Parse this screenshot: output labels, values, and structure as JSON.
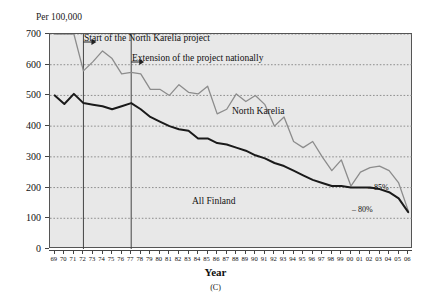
{
  "figure": {
    "unit_label": "Per 100,000",
    "xlabel": "Year",
    "caption": "(C)"
  },
  "annotations": {
    "start_project": "Start of the North Karelia project",
    "extension_project": "Extension of the project nationally",
    "pct_north_karelia": "– 85%",
    "pct_all_finland": "– 80%"
  },
  "series_labels": {
    "north_karelia": "North Karelia",
    "all_finland": "All Finland"
  },
  "colors": {
    "north_karelia": "#8c8c8c",
    "all_finland": "#1a1a1a",
    "plot_background": "#e8e8e8",
    "gridline": "#777777",
    "frame": "#555555",
    "marker_line": "#444444"
  },
  "chart_data": {
    "type": "line",
    "title": "",
    "subtitle": "",
    "xlabel": "Year",
    "ylabel": "Per 100,000",
    "ylim": [
      0,
      700
    ],
    "yticks": [
      0,
      100,
      200,
      300,
      400,
      500,
      600,
      700
    ],
    "grid": true,
    "legend": "inline-labels",
    "x": [
      "69",
      "70",
      "71",
      "72",
      "73",
      "74",
      "75",
      "76",
      "77",
      "78",
      "79",
      "80",
      "81",
      "82",
      "83",
      "84",
      "85",
      "86",
      "87",
      "88",
      "89",
      "90",
      "91",
      "92",
      "93",
      "94",
      "95",
      "96",
      "97",
      "98",
      "99",
      "00",
      "01",
      "02",
      "03",
      "04",
      "05",
      "06"
    ],
    "categories": [
      1969,
      1970,
      1971,
      1972,
      1973,
      1974,
      1975,
      1976,
      1977,
      1978,
      1979,
      1980,
      1981,
      1982,
      1983,
      1984,
      1985,
      1986,
      1987,
      1988,
      1989,
      1990,
      1991,
      1992,
      1993,
      1994,
      1995,
      1996,
      1997,
      1998,
      1999,
      2000,
      2001,
      2002,
      2003,
      2004,
      2005,
      2006
    ],
    "series": [
      {
        "name": "North Karelia",
        "color": "#8c8c8c",
        "values": [
          700,
          700,
          700,
          580,
          610,
          645,
          620,
          570,
          575,
          570,
          520,
          520,
          500,
          535,
          510,
          505,
          530,
          440,
          455,
          505,
          480,
          500,
          470,
          400,
          430,
          350,
          330,
          350,
          300,
          255,
          290,
          205,
          250,
          265,
          270,
          255,
          215,
          125
        ]
      },
      {
        "name": "All Finland",
        "color": "#1a1a1a",
        "values": [
          500,
          472,
          505,
          475,
          470,
          465,
          455,
          465,
          475,
          455,
          430,
          415,
          400,
          390,
          385,
          360,
          360,
          345,
          340,
          330,
          320,
          305,
          295,
          280,
          270,
          255,
          240,
          225,
          215,
          205,
          205,
          200,
          200,
          200,
          195,
          185,
          165,
          120
        ]
      }
    ],
    "markers": [
      {
        "x": "72",
        "label": "Start of the North Karelia project"
      },
      {
        "x": "77",
        "label": "Extension of the project nationally"
      }
    ],
    "annotations": [
      {
        "x": "01",
        "y": 255,
        "text": "– 85%"
      },
      {
        "x": "99",
        "y": 175,
        "text": "– 80%"
      }
    ]
  }
}
